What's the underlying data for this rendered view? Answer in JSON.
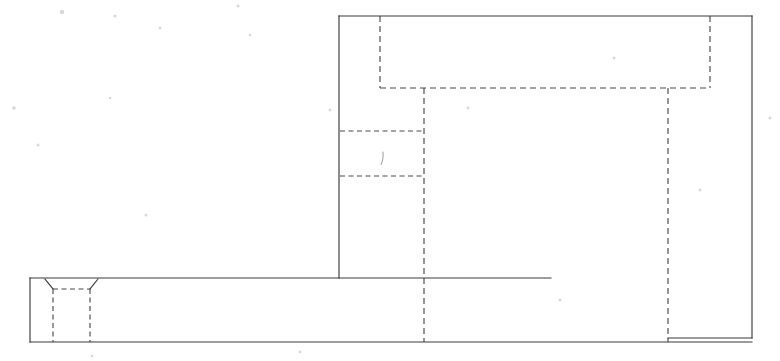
{
  "drawing": {
    "title": "Orthographic Section View",
    "background_color": "#ffffff",
    "visible_line_color": "#3a3a3a",
    "hidden_line_color": "#4a4a4a",
    "canvas": {
      "width": 780,
      "height": 361
    },
    "projection": "front elevation",
    "line_styles": {
      "visible": "solid",
      "hidden": "dashed"
    },
    "parts": [
      {
        "id": "vertical-member",
        "name": "Vertical Member",
        "type": "rectangle",
        "x1": 339,
        "y1": 16,
        "x2": 752,
        "y2": 338
      },
      {
        "id": "horizontal-slab",
        "name": "Horizontal Base Slab",
        "type": "rectangle",
        "x1": 30,
        "y1": 278,
        "x2": 752,
        "y2": 342
      }
    ],
    "visible_edges": [
      {
        "name": "vertical-member-top-edge",
        "x1": 339,
        "y1": 16,
        "x2": 752,
        "y2": 16
      },
      {
        "name": "vertical-member-right-edge",
        "x1": 752,
        "y1": 16,
        "x2": 752,
        "y2": 338
      },
      {
        "name": "vertical-member-left-edge",
        "x1": 339,
        "y1": 16,
        "x2": 339,
        "y2": 278
      },
      {
        "name": "slab-top-edge",
        "x1": 30,
        "y1": 278,
        "x2": 551,
        "y2": 278
      },
      {
        "name": "slab-left-edge",
        "x1": 30,
        "y1": 278,
        "x2": 30,
        "y2": 342
      },
      {
        "name": "slab-bottom-edge",
        "x1": 30,
        "y1": 342,
        "x2": 752,
        "y2": 342
      },
      {
        "name": "slab-right-lower-edge",
        "x1": 668,
        "y1": 338,
        "x2": 752,
        "y2": 338
      },
      {
        "name": "countersink-left-chamfer",
        "x1": 45,
        "y1": 279,
        "x2": 53,
        "y2": 289
      },
      {
        "name": "countersink-right-chamfer",
        "x1": 98,
        "y1": 279,
        "x2": 90,
        "y2": 289
      }
    ],
    "hidden_edges": [
      {
        "name": "upper-recess-bottom",
        "x1": 380,
        "y1": 88,
        "x2": 710,
        "y2": 88
      },
      {
        "name": "upper-recess-left",
        "x1": 380,
        "y1": 16,
        "x2": 380,
        "y2": 88
      },
      {
        "name": "upper-recess-right",
        "x1": 710,
        "y1": 16,
        "x2": 710,
        "y2": 88
      },
      {
        "name": "inner-bore-left",
        "x1": 424,
        "y1": 88,
        "x2": 424,
        "y2": 342
      },
      {
        "name": "inner-bore-right",
        "x1": 668,
        "y1": 88,
        "x2": 668,
        "y2": 342
      },
      {
        "name": "step-upper-ledge",
        "x1": 340,
        "y1": 131,
        "x2": 424,
        "y2": 131
      },
      {
        "name": "step-lower-ledge",
        "x1": 340,
        "y1": 176,
        "x2": 424,
        "y2": 176
      },
      {
        "name": "countersink-top",
        "x1": 53,
        "y1": 289,
        "x2": 90,
        "y2": 289
      },
      {
        "name": "countersink-bore-left",
        "x1": 53,
        "y1": 289,
        "x2": 53,
        "y2": 342
      },
      {
        "name": "countersink-bore-right",
        "x1": 90,
        "y1": 289,
        "x2": 90,
        "y2": 342
      }
    ],
    "annotations": []
  }
}
